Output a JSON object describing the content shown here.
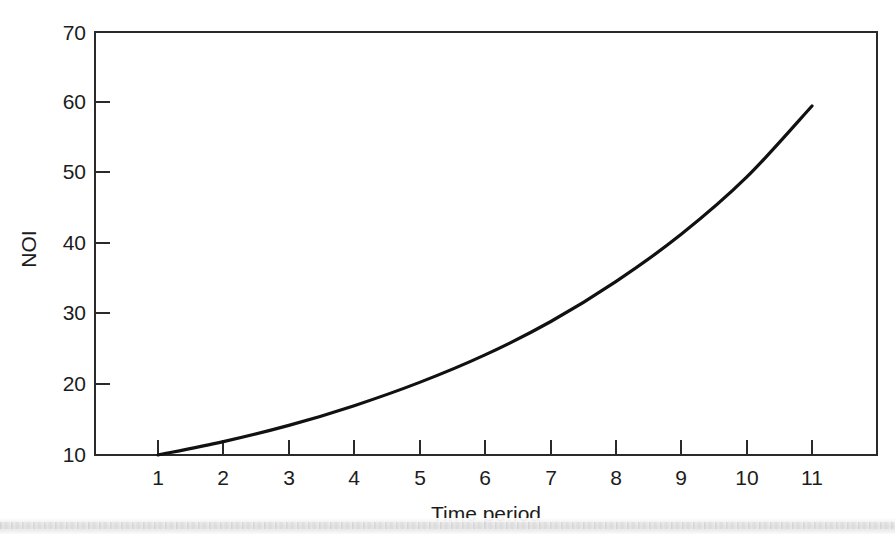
{
  "chart_data": {
    "type": "line",
    "title": "",
    "xlabel": "Time period",
    "ylabel": "NOI",
    "xlim": [
      0,
      12
    ],
    "ylim": [
      10,
      70
    ],
    "grid": false,
    "legend": "none",
    "x_ticks": [
      "1",
      "2",
      "3",
      "4",
      "5",
      "6",
      "7",
      "8",
      "9",
      "10",
      "11"
    ],
    "y_ticks": [
      "10",
      "20",
      "30",
      "40",
      "50",
      "60",
      "70"
    ],
    "x": [
      1,
      2,
      3,
      4,
      5,
      6,
      7,
      8,
      9,
      10,
      11
    ],
    "series": [
      {
        "name": "NOI",
        "values": [
          10.0,
          11.9,
          14.2,
          17.0,
          20.3,
          24.2,
          28.9,
          34.6,
          41.3,
          49.4,
          59.5
        ],
        "color": "#111111"
      }
    ]
  },
  "figure": {
    "background_color": "#ffffff",
    "axis_color": "#2a2a2a",
    "curve_color": "#111111"
  }
}
